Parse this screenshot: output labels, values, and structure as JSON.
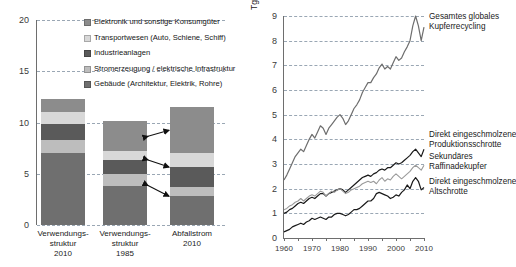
{
  "left_chart": {
    "name": "Kupfer Verwendungsstruktur und Abfallstrom Stapeldiagramm",
    "yticks": [
      "20",
      "15",
      "10",
      "5",
      "0"
    ],
    "legend": [
      {
        "label": "Elektronik und sonstige Konsumgüter",
        "color": "#8c8c8c",
        "key": "elektronik"
      },
      {
        "label": "Transportwesen (Auto, Schiene, Schiff)",
        "color": "#d8d8d8",
        "key": "transport"
      },
      {
        "label": "Industrieanlagen",
        "color": "#5a5a5a",
        "key": "industrie"
      },
      {
        "label": "Stromerzeugung / elektrische Infrastruktur",
        "color": "#bdbdbd",
        "key": "strom"
      },
      {
        "label": "Gebäude (Architektur, Elektrik, Rohre)",
        "color": "#6f6f6f",
        "key": "gebaeude"
      }
    ],
    "bars": [
      {
        "label_line1": "Verwendungs-",
        "label_line2": "struktur",
        "label_line3": "2010",
        "total": 12.3,
        "segments": [
          {
            "key": "gebaeude",
            "value": 7.0,
            "color": "#6f6f6f"
          },
          {
            "key": "strom",
            "value": 1.25,
            "color": "#bdbdbd"
          },
          {
            "key": "industrie",
            "value": 1.6,
            "color": "#5a5a5a"
          },
          {
            "key": "transport",
            "value": 1.15,
            "color": "#d8d8d8"
          },
          {
            "key": "elektronik",
            "value": 1.3,
            "color": "#8c8c8c"
          }
        ]
      },
      {
        "label_line1": "Verwendungs-",
        "label_line2": "struktur",
        "label_line3": "1985",
        "total": 10.1,
        "segments": [
          {
            "key": "gebaeude",
            "value": 3.85,
            "color": "#6f6f6f"
          },
          {
            "key": "strom",
            "value": 1.15,
            "color": "#bdbdbd"
          },
          {
            "key": "industrie",
            "value": 1.35,
            "color": "#5a5a5a"
          },
          {
            "key": "transport",
            "value": 0.85,
            "color": "#d8d8d8"
          },
          {
            "key": "elektronik",
            "value": 2.9,
            "color": "#8c8c8c"
          }
        ]
      },
      {
        "label_line1": "Abfallstrom",
        "label_line2": "2010",
        "label_line3": "",
        "total": 11.5,
        "segments": [
          {
            "key": "gebaeude",
            "value": 2.8,
            "color": "#6f6f6f"
          },
          {
            "key": "strom",
            "value": 0.95,
            "color": "#bdbdbd"
          },
          {
            "key": "industrie",
            "value": 1.9,
            "color": "#5a5a5a"
          },
          {
            "key": "transport",
            "value": 1.35,
            "color": "#d8d8d8"
          },
          {
            "key": "elektronik",
            "value": 4.5,
            "color": "#8c8c8c"
          }
        ]
      }
    ]
  },
  "right_chart": {
    "name": "Globales Kupferrecycling Zeitreihe",
    "ylabel": "Tg / a",
    "yticks": [
      "9",
      "8",
      "7",
      "6",
      "5",
      "4",
      "3",
      "2",
      "1",
      "0"
    ],
    "xticks": [
      "1960",
      "1970",
      "1980",
      "1990",
      "2000",
      "2010"
    ],
    "series_labels": [
      {
        "line1": "Gesamtes globales",
        "line2": "Kupferrecycling",
        "key": "gesamt"
      },
      {
        "line1": "Direkt eingeschmolzene",
        "line2": "Produktionsschrotte",
        "key": "produktionsschrotte"
      },
      {
        "line1": "Sekundäres",
        "line2": "Raffinadekupfer",
        "key": "raffinadekupfer"
      },
      {
        "line1": "Direkt eingeschmolzene",
        "line2": "Altschrotte",
        "key": "altschrotte"
      }
    ]
  },
  "chart_data": [
    {
      "type": "bar",
      "subtype": "stacked-bar",
      "title": "Verwendungsstruktur und Abfallstrom von Kupfer",
      "xlabel": "",
      "ylabel": "",
      "ylim": [
        0,
        20
      ],
      "yticks": [
        0,
        5,
        10,
        15,
        20
      ],
      "grid": true,
      "grid_style": "dashed-horizontal",
      "legend_position": "inside-top-right",
      "categories": [
        "Verwendungsstruktur 2010",
        "Verwendungsstruktur 1985",
        "Abfallstrom 2010"
      ],
      "series": [
        {
          "name": "Gebäude (Architektur, Elektrik, Rohre)",
          "color": "#6f6f6f",
          "values": [
            7.0,
            3.85,
            2.8
          ]
        },
        {
          "name": "Stromerzeugung / elektrische Infrastruktur",
          "color": "#bdbdbd",
          "values": [
            1.25,
            1.15,
            0.95
          ]
        },
        {
          "name": "Industrieanlagen",
          "color": "#5a5a5a",
          "values": [
            1.6,
            1.35,
            1.9
          ]
        },
        {
          "name": "Transportwesen (Auto, Schiene, Schiff)",
          "color": "#d8d8d8",
          "values": [
            1.15,
            0.85,
            1.35
          ]
        },
        {
          "name": "Elektronik und sonstige Konsumgüter",
          "color": "#8c8c8c",
          "values": [
            1.3,
            2.9,
            4.5
          ]
        }
      ],
      "totals": [
        12.3,
        10.1,
        11.5
      ],
      "annotations": [
        "Doppelpfeil: Elektronik und sonstige Konsumgüter (1985 -> Abfallstrom 2010)",
        "Doppelpfeil: Transportwesen (1985 -> Abfallstrom 2010)",
        "Doppelpfeil: Gebäude (1985 -> Abfallstrom 2010)"
      ]
    },
    {
      "type": "line",
      "title": "Globales Kupferrecycling",
      "xlabel": "",
      "ylabel": "Tg / a",
      "xlim": [
        1960,
        2010
      ],
      "ylim": [
        0,
        9
      ],
      "yticks": [
        0,
        1,
        2,
        3,
        4,
        5,
        6,
        7,
        8,
        9
      ],
      "xticks": [
        1960,
        1970,
        1980,
        1990,
        2000,
        2010
      ],
      "grid": true,
      "grid_style": "dashed-horizontal",
      "legend_position": "right-inline",
      "x": [
        1960,
        1961,
        1962,
        1963,
        1964,
        1965,
        1966,
        1967,
        1968,
        1969,
        1970,
        1971,
        1972,
        1973,
        1974,
        1975,
        1976,
        1977,
        1978,
        1979,
        1980,
        1981,
        1982,
        1983,
        1984,
        1985,
        1986,
        1987,
        1988,
        1989,
        1990,
        1991,
        1992,
        1993,
        1994,
        1995,
        1996,
        1997,
        1998,
        1999,
        2000,
        2001,
        2002,
        2003,
        2004,
        2005,
        2006,
        2007,
        2008,
        2009,
        2010
      ],
      "series": [
        {
          "name": "Gesamtes globales Kupferrecycling",
          "color": "#6e6e6e",
          "values": [
            2.35,
            2.55,
            2.8,
            3.05,
            3.3,
            3.45,
            3.6,
            3.5,
            3.75,
            4.0,
            4.2,
            4.05,
            4.3,
            4.55,
            4.45,
            4.2,
            4.45,
            4.6,
            4.75,
            4.9,
            5.0,
            4.85,
            4.6,
            4.75,
            5.0,
            5.25,
            5.4,
            5.6,
            5.9,
            6.1,
            6.3,
            6.3,
            6.5,
            6.65,
            6.9,
            7.05,
            6.85,
            6.95,
            6.85,
            7.1,
            7.35,
            7.2,
            7.3,
            7.55,
            7.75,
            8.0,
            8.6,
            9.0,
            8.6,
            8.0,
            8.55
          ]
        },
        {
          "name": "Direkt eingeschmolzene Produktionsschrotte",
          "color": "#1a1a1a",
          "values": [
            1.0,
            1.05,
            1.15,
            1.2,
            1.3,
            1.4,
            1.45,
            1.4,
            1.5,
            1.6,
            1.65,
            1.6,
            1.7,
            1.8,
            1.8,
            1.7,
            1.8,
            1.85,
            1.9,
            1.95,
            2.0,
            1.95,
            1.85,
            1.95,
            2.05,
            2.15,
            2.25,
            2.35,
            2.45,
            2.5,
            2.55,
            2.5,
            2.6,
            2.65,
            2.75,
            2.8,
            2.75,
            2.85,
            2.85,
            2.95,
            3.05,
            3.0,
            3.05,
            3.15,
            3.25,
            3.35,
            3.5,
            3.6,
            3.45,
            3.3,
            3.6
          ]
        },
        {
          "name": "Sekundäres Raffinadekupfer",
          "color": "#9a9a9a",
          "values": [
            1.15,
            1.2,
            1.3,
            1.35,
            1.45,
            1.5,
            1.6,
            1.5,
            1.6,
            1.7,
            1.75,
            1.7,
            1.8,
            1.9,
            1.85,
            1.7,
            1.8,
            1.9,
            1.85,
            1.95,
            2.0,
            1.9,
            1.8,
            1.85,
            1.95,
            2.0,
            2.05,
            2.1,
            2.2,
            2.25,
            2.3,
            2.25,
            2.3,
            2.2,
            2.35,
            2.45,
            2.3,
            2.4,
            2.35,
            2.5,
            2.6,
            2.5,
            2.4,
            2.5,
            2.6,
            2.7,
            2.85,
            2.95,
            2.85,
            2.75,
            2.95
          ]
        },
        {
          "name": "Direkt eingeschmolzene Altschrotte",
          "color": "#1a1a1a",
          "values": [
            0.25,
            0.3,
            0.35,
            0.45,
            0.5,
            0.55,
            0.6,
            0.55,
            0.65,
            0.7,
            0.8,
            0.75,
            0.8,
            0.85,
            0.8,
            0.75,
            0.85,
            0.85,
            0.95,
            1.0,
            1.0,
            0.95,
            0.9,
            0.95,
            1.05,
            1.15,
            1.15,
            1.2,
            1.3,
            1.4,
            1.5,
            1.5,
            1.6,
            1.8,
            1.85,
            1.8,
            1.75,
            1.7,
            1.6,
            1.65,
            1.75,
            1.7,
            1.85,
            1.95,
            2.15,
            2.0,
            2.3,
            2.45,
            2.3,
            1.95,
            2.05
          ]
        }
      ]
    }
  ]
}
